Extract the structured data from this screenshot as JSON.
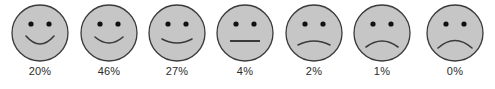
{
  "widget": {
    "name": "satisfaction-face-rating-scale",
    "background_color": "#ffffff"
  },
  "style": {
    "face_fill": "#c6c6c6",
    "face_stroke": "#3a3a3a",
    "eye_color": "#111111",
    "mouth_color": "#3a3a3a",
    "label_color": "#2b2b2b"
  },
  "chart_data": {
    "type": "bar",
    "title": "",
    "xlabel": "",
    "ylabel": "",
    "categories": [
      "very-happy",
      "happy",
      "slightly-happy",
      "neutral",
      "slightly-sad",
      "sad",
      "very-sad"
    ],
    "values": [
      20,
      46,
      27,
      4,
      2,
      1,
      0
    ],
    "labels": [
      "20%",
      "46%",
      "27%",
      "4%",
      "2%",
      "1%",
      "0%"
    ],
    "ylim": [
      0,
      100
    ],
    "grid": false,
    "legend": null
  },
  "faces": [
    {
      "id": "face-1",
      "icon_name": "face-very-happy-icon",
      "expression": "very-happy",
      "label": "20%",
      "value": 20,
      "left": 6,
      "mouth_path": "M 16 34 Q 30 50 44 34",
      "mouth_is_line": false
    },
    {
      "id": "face-2",
      "icon_name": "face-happy-icon",
      "expression": "happy",
      "label": "46%",
      "value": 46,
      "left": 75,
      "mouth_path": "M 16 35 Q 30 47 44 35",
      "mouth_is_line": false
    },
    {
      "id": "face-3",
      "icon_name": "face-slightly-happy-icon",
      "expression": "slightly-happy",
      "label": "27%",
      "value": 27,
      "left": 143,
      "mouth_path": "M 15 37 Q 30 45 45 37",
      "mouth_is_line": false
    },
    {
      "id": "face-4",
      "icon_name": "face-neutral-icon",
      "expression": "neutral",
      "label": "4%",
      "value": 4,
      "left": 211,
      "mouth_path": "M 15 39 L 45 39",
      "mouth_is_line": true
    },
    {
      "id": "face-5",
      "icon_name": "face-slightly-sad-icon",
      "expression": "slightly-sad",
      "label": "2%",
      "value": 2,
      "left": 280,
      "mouth_path": "M 14 43 Q 30 35 46 43",
      "mouth_is_line": false
    },
    {
      "id": "face-6",
      "icon_name": "face-sad-icon",
      "expression": "sad",
      "label": "1%",
      "value": 1,
      "left": 348,
      "mouth_path": "M 14 45 Q 30 33 46 45",
      "mouth_is_line": false
    },
    {
      "id": "face-7",
      "icon_name": "face-very-sad-icon",
      "expression": "very-sad",
      "label": "0%",
      "value": 0,
      "left": 421,
      "mouth_path": "M 13 46 Q 30 31 47 46",
      "mouth_is_line": false
    }
  ]
}
